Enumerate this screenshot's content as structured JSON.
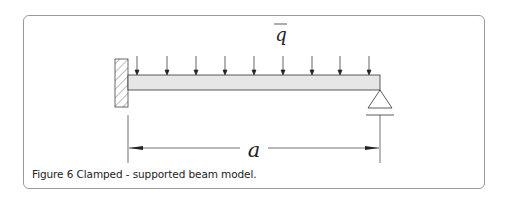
{
  "figure": {
    "caption_label": "Figure 6",
    "caption_text": "Clamped - supported beam model.",
    "load_symbol": "q",
    "length_symbol": "a",
    "load_arrow_count": 9,
    "left_support": "clamped",
    "right_support": "pinned"
  }
}
